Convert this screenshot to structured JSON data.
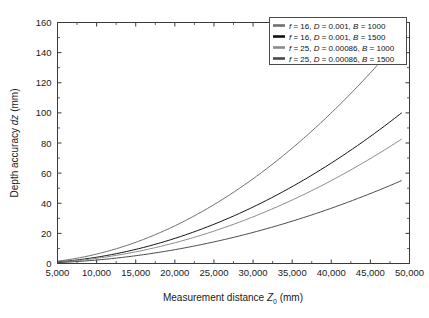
{
  "chart_data": {
    "type": "line",
    "title": "",
    "xlabel": "Measurement distance Z0 (mm)",
    "ylabel": "Depth accuracy dz (mm)",
    "xlabel_parts": {
      "pre": "Measurement distance ",
      "var": "Z",
      "sub": "0",
      "post": " (mm)"
    },
    "ylabel_parts": {
      "pre": "Depth accuracy ",
      "var": "dz",
      "post": " (mm)"
    },
    "xlim": [
      5000,
      50000
    ],
    "ylim": [
      0,
      160
    ],
    "xticks": [
      5000,
      10000,
      15000,
      20000,
      25000,
      30000,
      35000,
      40000,
      45000,
      50000
    ],
    "xtick_labels": [
      "5,000",
      "10,000",
      "15,000",
      "20,000",
      "25,000",
      "30,000",
      "35,000",
      "40,000",
      "45,000",
      "50,000"
    ],
    "yticks": [
      0,
      20,
      40,
      60,
      80,
      100,
      120,
      140,
      160
    ],
    "ytick_labels": [
      "0",
      "20",
      "40",
      "60",
      "80",
      "100",
      "120",
      "140",
      "160"
    ],
    "grid": false,
    "legend_position": "upper right",
    "x": [
      5000,
      10000,
      15000,
      20000,
      25000,
      30000,
      35000,
      40000,
      45000,
      49000
    ],
    "series": [
      {
        "name": "f = 16, D = 0.001, B = 1000",
        "label_parts": {
          "f_var": "f",
          "f_val": " = 16, ",
          "d_var": "D",
          "d_val": " = 0.001, ",
          "b_var": "B",
          "b_val": " = 1000"
        },
        "color": "#6e6e6e",
        "f": 16,
        "D": 0.001,
        "B": 1000,
        "values": [
          1.56,
          6.25,
          14.06,
          25.0,
          39.06,
          56.25,
          76.56,
          100.0,
          126.56,
          150.06
        ]
      },
      {
        "name": "f = 16, D = 0.001, B = 1500",
        "label_parts": {
          "f_var": "f",
          "f_val": " = 16, ",
          "d_var": "D",
          "d_val": " = 0.001, ",
          "b_var": "B",
          "b_val": " = 1500"
        },
        "color": "#111111",
        "f": 16,
        "D": 0.001,
        "B": 1500,
        "values": [
          1.04,
          4.17,
          9.38,
          16.67,
          26.04,
          37.5,
          51.04,
          66.67,
          84.38,
          100.04
        ]
      },
      {
        "name": "f = 25, D = 0.00086, B = 1000",
        "label_parts": {
          "f_var": "f",
          "f_val": " = 25, ",
          "d_var": "D",
          "d_val": " = 0.00086, ",
          "b_var": "B",
          "b_val": " = 1000"
        },
        "color": "#8a8a8a",
        "f": 25,
        "D": 0.00086,
        "B": 1000,
        "values": [
          0.86,
          3.44,
          7.74,
          13.76,
          21.5,
          30.96,
          42.14,
          55.04,
          69.66,
          82.62
        ]
      },
      {
        "name": "f = 25, D = 0.00086, B = 1500",
        "label_parts": {
          "f_var": "f",
          "f_val": " = 25, ",
          "d_var": "D",
          "d_val": " = 0.00086, ",
          "b_var": "B",
          "b_val": " = 1500"
        },
        "color": "#4a4a4a",
        "f": 25,
        "D": 0.00086,
        "B": 1500,
        "values": [
          0.57,
          2.29,
          5.16,
          9.17,
          14.33,
          20.64,
          28.09,
          36.69,
          46.44,
          55.08
        ]
      }
    ]
  },
  "axes": {
    "frame_color": "#3a3a3a",
    "background": "#ffffff"
  }
}
